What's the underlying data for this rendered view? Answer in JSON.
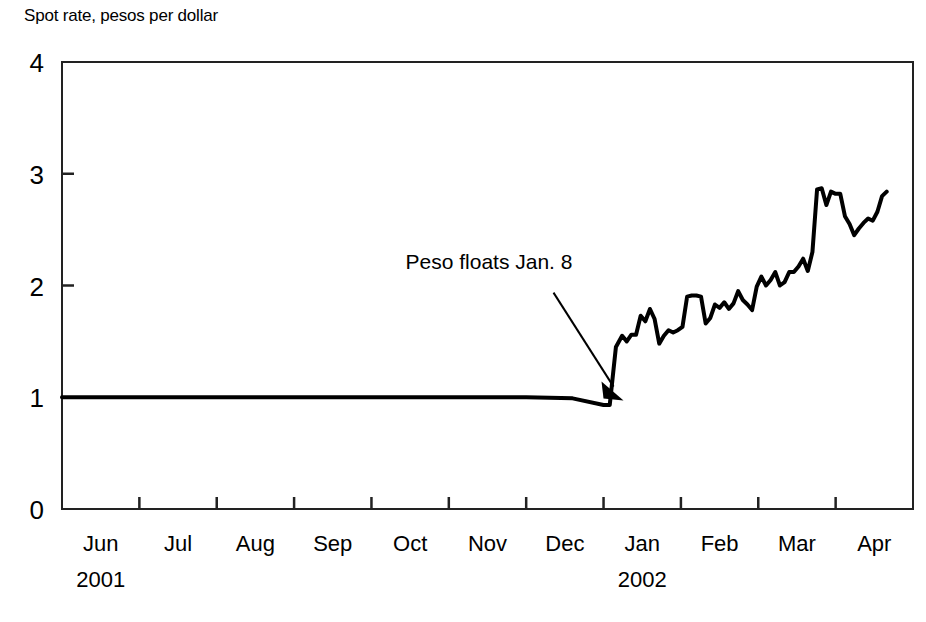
{
  "chart_data": {
    "type": "line",
    "title": "Spot rate, pesos per dollar",
    "xlabel": "",
    "ylabel": "Spot rate, pesos per dollar",
    "ylim": [
      0,
      4
    ],
    "yticks": [
      0,
      1,
      2,
      3,
      4
    ],
    "ytick_labels": [
      "0",
      "1",
      "2",
      "3",
      "4"
    ],
    "grid": false,
    "legend": "none",
    "xlim": [
      "2001-06-01",
      "2002-04-30"
    ],
    "categories": [
      "Jun",
      "Jul",
      "Aug",
      "Sep",
      "Oct",
      "Nov",
      "Dec",
      "Jan",
      "Feb",
      "Mar",
      "Apr"
    ],
    "xtick_labels": [
      "Jun",
      "Jul",
      "Aug",
      "Sep",
      "Oct",
      "Nov",
      "Dec",
      "Jan",
      "Feb",
      "Mar",
      "Apr"
    ],
    "xtick_years": [
      {
        "label": "2001",
        "at": "Jun"
      },
      {
        "label": "2002",
        "at": "Jan"
      }
    ],
    "annotations": [
      {
        "text": "Peso floats Jan. 8",
        "x": "2002-01-08",
        "y": 0.97,
        "arrow": true
      }
    ],
    "series": [
      {
        "name": "Spot rate",
        "color": "#000000",
        "x": [
          0.0,
          1.0,
          2.0,
          3.0,
          4.0,
          5.0,
          6.0,
          6.6,
          7.0,
          7.08,
          7.16,
          7.24,
          7.3,
          7.36,
          7.42,
          7.48,
          7.54,
          7.6,
          7.66,
          7.72,
          7.78,
          7.84,
          7.9,
          7.96,
          8.02,
          8.08,
          8.14,
          8.2,
          8.26,
          8.32,
          8.38,
          8.44,
          8.5,
          8.56,
          8.62,
          8.68,
          8.74,
          8.8,
          8.86,
          8.92,
          8.98,
          9.04,
          9.1,
          9.16,
          9.22,
          9.28,
          9.34,
          9.4,
          9.46,
          9.52,
          9.58,
          9.64,
          9.7,
          9.76,
          9.82,
          9.88,
          9.94,
          10.0,
          10.06,
          10.12,
          10.18,
          10.24,
          10.3,
          10.36,
          10.42,
          10.48,
          10.54,
          10.6,
          10.66
        ],
        "values": [
          1.0,
          1.0,
          1.0,
          1.0,
          1.0,
          1.0,
          1.0,
          0.99,
          0.93,
          0.93,
          1.45,
          1.55,
          1.5,
          1.56,
          1.56,
          1.73,
          1.68,
          1.79,
          1.7,
          1.48,
          1.55,
          1.6,
          1.58,
          1.6,
          1.63,
          1.9,
          1.91,
          1.91,
          1.9,
          1.66,
          1.71,
          1.83,
          1.8,
          1.85,
          1.79,
          1.84,
          1.95,
          1.87,
          1.83,
          1.78,
          1.99,
          2.08,
          2.0,
          2.05,
          2.12,
          2.0,
          2.03,
          2.12,
          2.12,
          2.17,
          2.24,
          2.13,
          2.3,
          2.86,
          2.87,
          2.72,
          2.84,
          2.82,
          2.82,
          2.62,
          2.55,
          2.45,
          2.51,
          2.56,
          2.6,
          2.58,
          2.66,
          2.8,
          2.84
        ]
      }
    ]
  }
}
